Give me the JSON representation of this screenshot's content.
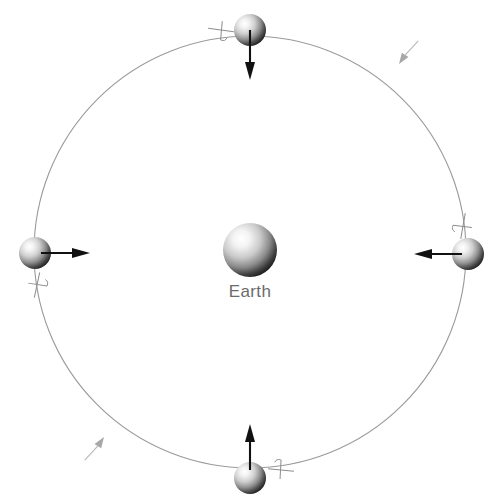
{
  "figure": {
    "type": "orbital-diagram",
    "background_color": "#ffffff",
    "width": 500,
    "height": 500,
    "caption": ""
  },
  "center_body": {
    "name": "earth",
    "label": "Earth",
    "label_color": "#6b6b6b",
    "cx": 250,
    "cy": 250,
    "r": 27,
    "highlight_color": "#fbfbfb",
    "shadow_color": "#1a1a1a"
  },
  "orbit": {
    "name": "orbit-path",
    "cx": 250,
    "cy": 252,
    "r": 216,
    "stroke_color": "#9a9a9a",
    "stroke_width": 1.1,
    "direction": "counter-clockwise",
    "direction_markers": [
      {
        "name": "orbit-direction-arrow-upper-right",
        "x": 399,
        "y": 64,
        "angle": -56
      },
      {
        "name": "orbit-direction-arrow-lower-left",
        "x": 104,
        "y": 437,
        "angle": 124
      }
    ]
  },
  "moons": [
    {
      "name": "moon-top",
      "position": "top",
      "cx": 250,
      "cy": 30,
      "r": 16,
      "arrow": {
        "name": "arrow-toward-earth-down",
        "direction": "down",
        "length": 44,
        "color": "#111111"
      },
      "tick": {
        "name": "rotation-tick-top",
        "x": 221,
        "y": 30,
        "angle": 8
      }
    },
    {
      "name": "moon-right",
      "position": "right",
      "cx": 468,
      "cy": 254,
      "r": 16,
      "arrow": {
        "name": "arrow-toward-earth-left",
        "direction": "left",
        "length": 44,
        "color": "#111111"
      },
      "tick": {
        "name": "rotation-tick-right",
        "x": 463,
        "y": 226,
        "angle": 100
      }
    },
    {
      "name": "moon-bottom",
      "position": "bottom",
      "cx": 250,
      "cy": 478,
      "r": 16,
      "arrow": {
        "name": "arrow-toward-earth-up",
        "direction": "up",
        "length": 44,
        "color": "#111111"
      },
      "tick": {
        "name": "rotation-tick-bottom",
        "x": 281,
        "y": 470,
        "angle": 186
      }
    },
    {
      "name": "moon-left",
      "position": "left",
      "cx": 35,
      "cy": 253,
      "r": 16,
      "arrow": {
        "name": "arrow-toward-earth-right",
        "direction": "right",
        "length": 44,
        "color": "#111111"
      },
      "tick": {
        "name": "rotation-tick-left",
        "x": 37,
        "y": 285,
        "angle": 282
      }
    }
  ],
  "colors": {
    "orbit_line": "#9a9a9a",
    "arrow": "#111111",
    "tick": "#8d8d8d",
    "label_text": "#6b6b6b"
  }
}
